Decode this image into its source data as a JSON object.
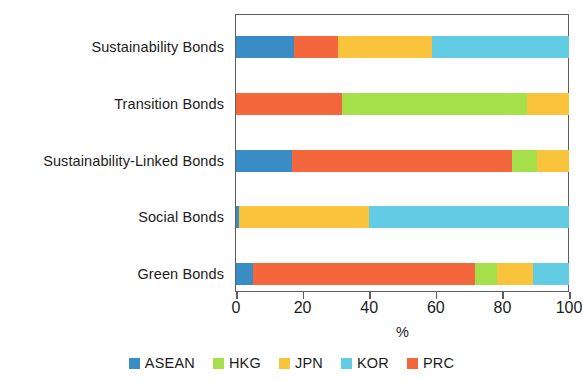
{
  "chart_data": {
    "type": "bar",
    "orientation": "horizontal",
    "stacked": true,
    "title": "",
    "subtitle": "",
    "xlabel": "%",
    "ylabel": "",
    "xlim": [
      0,
      100
    ],
    "xticks": [
      0,
      20,
      40,
      60,
      80,
      100
    ],
    "xticklabels": [
      "0",
      "20",
      "40",
      "60",
      "80",
      "100"
    ],
    "grid": false,
    "legend_position": "bottom-center",
    "categories": [
      "Sustainability Bonds",
      "Transition Bonds",
      "Sustainability-Linked Bonds",
      "Social Bonds",
      "Green Bonds"
    ],
    "series": [
      {
        "name": "ASEAN",
        "color": "#3a8dc4",
        "values": [
          17.5,
          0,
          16.8,
          0.8,
          5.1
        ]
      },
      {
        "name": "HKG",
        "color": "#a5e04a",
        "values": [
          0,
          55.6,
          7.4,
          0,
          6.6
        ]
      },
      {
        "name": "JPN",
        "color": "#f9c33c",
        "values": [
          28.4,
          12.6,
          9.6,
          39.1,
          10.8
        ]
      },
      {
        "name": "KOR",
        "color": "#62cce4",
        "values": [
          41.1,
          0,
          0,
          60.1,
          10.8
        ]
      },
      {
        "name": "PRC",
        "color": "#f4673c",
        "values": [
          13.0,
          31.8,
          66.2,
          0,
          66.7
        ]
      }
    ],
    "stack_order": [
      "ASEAN",
      "PRC",
      "JPN",
      "KOR",
      "HKG"
    ],
    "bars": [
      {
        "category": "Sustainability Bonds",
        "segments": [
          {
            "name": "ASEAN",
            "value": 17.5
          },
          {
            "name": "PRC",
            "value": 13.0
          },
          {
            "name": "JPN",
            "value": 28.4
          },
          {
            "name": "KOR",
            "value": 41.1
          }
        ]
      },
      {
        "category": "Transition Bonds",
        "segments": [
          {
            "name": "PRC",
            "value": 31.8
          },
          {
            "name": "HKG",
            "value": 55.6
          },
          {
            "name": "JPN",
            "value": 12.6
          }
        ]
      },
      {
        "category": "Sustainability-Linked Bonds",
        "segments": [
          {
            "name": "ASEAN",
            "value": 16.8
          },
          {
            "name": "PRC",
            "value": 66.2
          },
          {
            "name": "HKG",
            "value": 7.4
          },
          {
            "name": "JPN",
            "value": 9.6
          }
        ]
      },
      {
        "category": "Social Bonds",
        "segments": [
          {
            "name": "ASEAN",
            "value": 0.8
          },
          {
            "name": "JPN",
            "value": 39.1
          },
          {
            "name": "KOR",
            "value": 60.1
          }
        ]
      },
      {
        "category": "Green Bonds",
        "segments": [
          {
            "name": "ASEAN",
            "value": 5.1
          },
          {
            "name": "PRC",
            "value": 66.7
          },
          {
            "name": "HKG",
            "value": 6.6
          },
          {
            "name": "JPN",
            "value": 10.8
          },
          {
            "name": "KOR",
            "value": 10.8
          }
        ]
      }
    ],
    "legend": [
      {
        "label": "ASEAN",
        "color": "#3a8dc4"
      },
      {
        "label": "HKG",
        "color": "#a5e04a"
      },
      {
        "label": "JPN",
        "color": "#f9c33c"
      },
      {
        "label": "KOR",
        "color": "#62cce4"
      },
      {
        "label": "PRC",
        "color": "#f4673c"
      }
    ]
  },
  "colors": {
    "ASEAN": "#3a8dc4",
    "HKG": "#a5e04a",
    "JPN": "#f9c33c",
    "KOR": "#62cce4",
    "PRC": "#f4673c",
    "axis": "#5d5d5d",
    "text": "#1c1c1c",
    "background": "#ffffff"
  }
}
